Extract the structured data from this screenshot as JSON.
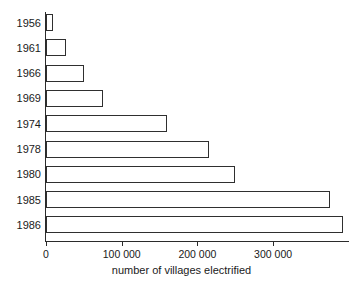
{
  "chart_data": {
    "type": "bar",
    "orientation": "horizontal",
    "title": "",
    "xlabel": "number of villages electrified",
    "ylabel": "",
    "categories": [
      "1956",
      "1961",
      "1966",
      "1969",
      "1974",
      "1978",
      "1980",
      "1985",
      "1986"
    ],
    "values": [
      9000,
      26000,
      50000,
      75000,
      160000,
      215000,
      250000,
      375000,
      392000
    ],
    "xlim": [
      0,
      400000
    ],
    "xticks": [
      0,
      100000,
      200000,
      300000
    ],
    "xtick_labels": [
      "0",
      "100 000",
      "200 000",
      "300 000"
    ],
    "grid": false,
    "legend": null,
    "series": [
      {
        "name": "number of villages electrified",
        "values": [
          9000,
          26000,
          50000,
          75000,
          160000,
          215000,
          250000,
          375000,
          392000
        ]
      }
    ],
    "bar_fill_color": "#ffffff",
    "bar_edge_color": "#2f2f2f",
    "axis_color": "#2b2b2b",
    "background_color": "#ffffff"
  }
}
